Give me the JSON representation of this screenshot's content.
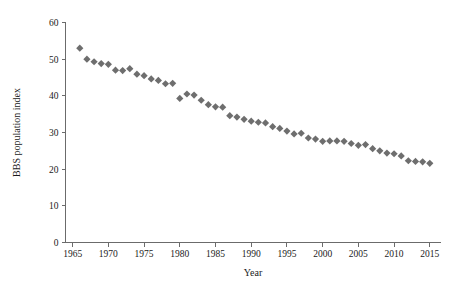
{
  "chart_data": {
    "type": "scatter",
    "title": "",
    "subtitle": "",
    "xlabel": "Year",
    "ylabel": "BBS population index",
    "xlim": [
      1964.0,
      2016.5
    ],
    "ylim": [
      0,
      60
    ],
    "xticks": [
      1965,
      1970,
      1975,
      1980,
      1985,
      1990,
      1995,
      2000,
      2005,
      2010,
      2015
    ],
    "yticks": [
      0,
      10,
      20,
      30,
      40,
      50,
      60
    ],
    "grid": false,
    "legend": null,
    "legend_position": "none",
    "marker_shape": "diamond",
    "marker_color": "#6e6e6e",
    "axis_color": "#6b6b6b",
    "text_color": "#1a1a1a",
    "series": [
      {
        "name": "BBS population index",
        "x": [
          1966,
          1967,
          1968,
          1969,
          1970,
          1971,
          1972,
          1973,
          1974,
          1975,
          1976,
          1977,
          1978,
          1979,
          1980,
          1981,
          1982,
          1983,
          1984,
          1985,
          1986,
          1987,
          1988,
          1989,
          1990,
          1991,
          1992,
          1993,
          1994,
          1995,
          1996,
          1997,
          1998,
          1999,
          2000,
          2001,
          2002,
          2003,
          2004,
          2005,
          2006,
          2007,
          2008,
          2009,
          2010,
          2011,
          2012,
          2013,
          2014,
          2015
        ],
        "values": [
          53.0,
          50.0,
          49.3,
          48.8,
          48.6,
          47.0,
          46.9,
          47.4,
          45.9,
          45.5,
          44.6,
          44.2,
          43.3,
          43.4,
          39.3,
          40.5,
          40.2,
          38.8,
          37.6,
          37.0,
          36.9,
          34.6,
          34.2,
          33.6,
          33.1,
          32.8,
          32.6,
          31.6,
          31.1,
          30.4,
          29.6,
          29.8,
          28.5,
          28.2,
          27.6,
          27.7,
          27.7,
          27.6,
          27.0,
          26.5,
          26.7,
          25.6,
          25.0,
          24.4,
          24.2,
          23.6,
          22.3,
          22.1,
          22.0,
          21.6
        ]
      }
    ]
  }
}
